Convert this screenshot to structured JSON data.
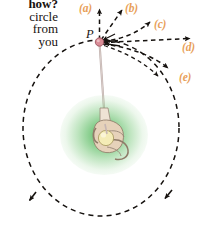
{
  "figure": {
    "background_color": "#ffffff"
  },
  "caption": {
    "lines": [
      {
        "text": "how?",
        "bold": true
      },
      {
        "text": "circle",
        "bold": false
      },
      {
        "text": "from",
        "bold": false
      },
      {
        "text": "you",
        "bold": false
      }
    ]
  },
  "pivot": {
    "label": "P",
    "dot_color": "#d98c96",
    "dot_outline": "#8c4a52",
    "x": 99,
    "y": 42
  },
  "string": {
    "color": "#b9a9a6",
    "from_x": 99,
    "from_y": 42,
    "to_x": 105,
    "to_y": 124
  },
  "hand": {
    "name": "hand-holding-string",
    "glow_color": "#3fae4a",
    "skin_color": "#e3cdb4",
    "ball_color": "#f2e9b0",
    "center_x": 104,
    "center_y": 136
  },
  "orbit": {
    "name": "dashed-circular-path",
    "stroke_color": "#16120f",
    "center_x": 101,
    "center_y": 128,
    "radius_x": 78,
    "radius_y": 88,
    "direction": "counterclockwise",
    "dash": "5 4"
  },
  "vectors": [
    {
      "id": "a",
      "label": "(a)",
      "label_x": 79,
      "label_y": 2,
      "description": "straight up, tangent-normal candidate",
      "color": "#e8a05a",
      "arrow_color": "#16120f"
    },
    {
      "id": "b",
      "label": "(b)",
      "label_x": 125,
      "label_y": 2,
      "description": "up and to the right, diagonal",
      "color": "#e8a05a",
      "arrow_color": "#16120f"
    },
    {
      "id": "c",
      "label": "(c)",
      "label_x": 153,
      "label_y": 18,
      "description": "curving up and to the right",
      "color": "#e8a05a",
      "arrow_color": "#16120f"
    },
    {
      "id": "d",
      "label": "(d)",
      "label_x": 183,
      "label_y": 40,
      "description": "horizontal, straight to the right (tangent)",
      "color": "#e8a05a",
      "arrow_color": "#16120f"
    },
    {
      "id": "e",
      "label": "(e)",
      "label_x": 180,
      "label_y": 70,
      "description": "curving down and to the right",
      "color": "#e8a05a",
      "arrow_color": "#16120f"
    }
  ],
  "path_arrowheads": [
    {
      "name": "orbit-arrow-left",
      "x": 31,
      "y": 200
    },
    {
      "name": "orbit-arrow-right",
      "x": 166,
      "y": 198
    }
  ]
}
